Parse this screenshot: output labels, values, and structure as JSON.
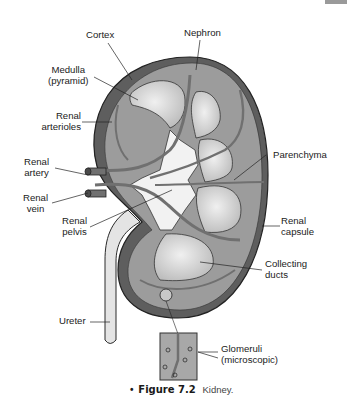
{
  "figure": {
    "number_label": "Figure 7.2",
    "title": "Kidney.",
    "bullet": "•"
  },
  "labels": {
    "cortex": [
      "Cortex"
    ],
    "nephron": [
      "Nephron"
    ],
    "medulla": [
      "Medulla",
      "(pyramid)"
    ],
    "renal_arterioles": [
      "Renal",
      "arterioles"
    ],
    "renal_artery": [
      "Renal",
      "artery"
    ],
    "renal_vein": [
      "Renal",
      "vein"
    ],
    "renal_pelvis": [
      "Renal",
      "pelvis"
    ],
    "parenchyma": [
      "Parenchyma"
    ],
    "renal_capsule": [
      "Renal",
      "capsule"
    ],
    "collecting_ducts": [
      "Collecting",
      "ducts"
    ],
    "ureter": [
      "Ureter"
    ],
    "glomeruli": [
      "Glomeruli",
      "(microscopic)"
    ]
  },
  "colors": {
    "capsule_dark": "#5e5e5e",
    "cortex_gray": "#9c9c9c",
    "pyramid_light": "#d8d8d8",
    "pelvis_white": "#f2f2f2",
    "vessel_gray": "#707070",
    "outline": "#2a2a2a",
    "inset_bg": "#a8a8a8"
  }
}
